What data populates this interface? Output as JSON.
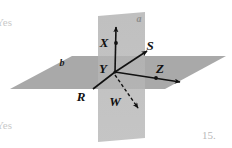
{
  "page": {
    "width": 232,
    "height": 148,
    "background": "#ffffff",
    "figure_number": "15."
  },
  "margin_notes": [
    {
      "name": "yes-top",
      "text": "Yes"
    },
    {
      "name": "yes-bottom",
      "text": "Yes"
    }
  ],
  "figure": {
    "type": "geometry-diagram",
    "plane_fill": "#a8a8a8",
    "plane_fill_light": "#bdbdbd",
    "line_color": "#111111",
    "planes": [
      {
        "name": "vertical-plane",
        "label": "a",
        "label_x": 139,
        "label_y": 22,
        "label_color": "#8d8d8d",
        "points": "98,16 145,12 145,138 98,142"
      },
      {
        "name": "horizontal-plane",
        "label": "b",
        "label_x": 62,
        "label_y": 66,
        "label_color": "#1a1a1a",
        "points": "10,89 72,56 226,56 165,89"
      }
    ],
    "origin": {
      "name": "Y",
      "x": 115,
      "y": 72
    },
    "rays": [
      {
        "name": "ray-X",
        "label": "X",
        "label_x": 104,
        "label_y": 47,
        "from_x": 115,
        "from_y": 72,
        "to_x": 116,
        "to_y": 27,
        "dashed": false,
        "dot_x": 116,
        "dot_y": 43
      },
      {
        "name": "ray-S",
        "label": "S",
        "label_x": 150,
        "label_y": 50,
        "from_x": 115,
        "from_y": 72,
        "to_x": 147,
        "to_y": 51,
        "dashed": false,
        "dot_x": 0,
        "dot_y": 0
      },
      {
        "name": "ray-Z",
        "label": "Z",
        "label_x": 160,
        "label_y": 73,
        "from_x": 115,
        "from_y": 72,
        "to_x": 180,
        "to_y": 82,
        "dashed": false,
        "dot_x": 156,
        "dot_y": 78
      },
      {
        "name": "ray-W",
        "label": "W",
        "label_x": 115,
        "label_y": 106,
        "from_x": 115,
        "from_y": 75,
        "to_x": 138,
        "to_y": 108,
        "dashed": true,
        "dot_x": 0,
        "dot_y": 0
      },
      {
        "name": "ray-R",
        "label": "R",
        "label_x": 81,
        "label_y": 101,
        "from_x": 115,
        "from_y": 72,
        "to_x": 93,
        "to_y": 89,
        "dashed": false,
        "dot_x": 0,
        "dot_y": 0
      }
    ],
    "labels": [
      "X",
      "S",
      "Y",
      "Z",
      "W",
      "R",
      "a",
      "b"
    ]
  }
}
